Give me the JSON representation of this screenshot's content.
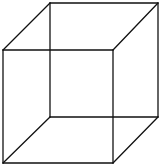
{
  "figure": {
    "type": "necker-cube",
    "stroke_color": "#111111",
    "background": "#ffffff",
    "front_face": [
      [
        3,
        50
      ],
      [
        113,
        50
      ],
      [
        113,
        163
      ],
      [
        3,
        163
      ]
    ],
    "back_face": [
      [
        50,
        3
      ],
      [
        158,
        3
      ],
      [
        158,
        117
      ],
      [
        50,
        117
      ]
    ]
  }
}
